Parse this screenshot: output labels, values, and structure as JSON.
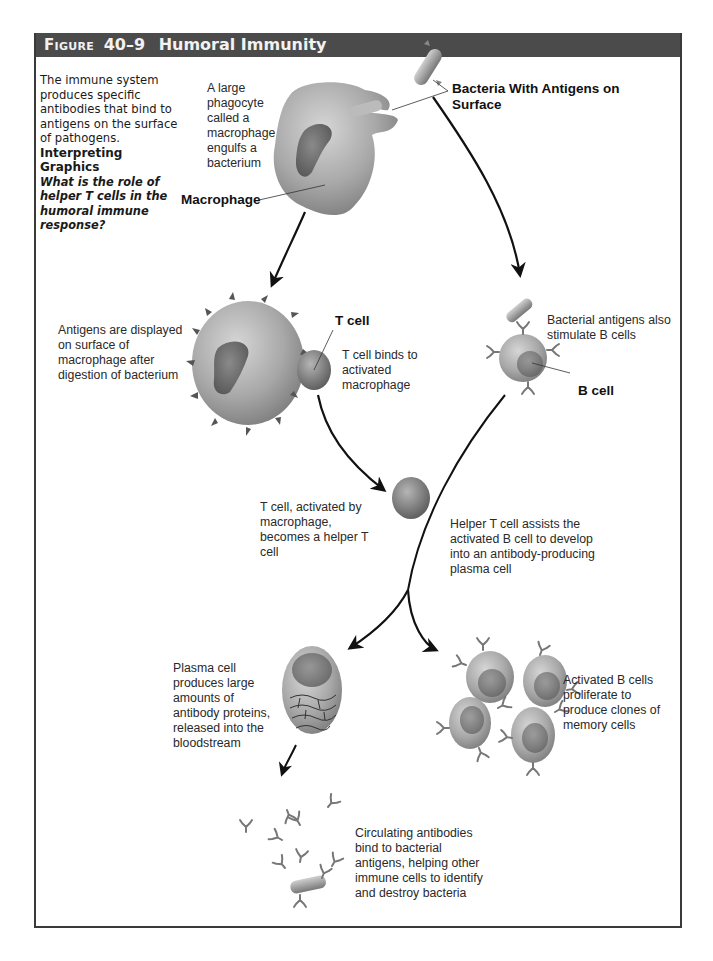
{
  "figure": {
    "label": "Figure",
    "number": "40–9",
    "title": "Humoral Immunity",
    "colors": {
      "titlebar": "#4b4b4b",
      "title_text": "#f2f2f2",
      "frame": "#3a3a3a",
      "cell_gray": "#9a9a9a",
      "nucleus": "#6e6e6e",
      "arrow": "#111111"
    }
  },
  "intro": {
    "text": "The immune system produces specific antibodies that bind to antigens on the surface of pathogens.",
    "heading": "Interpreting Graphics",
    "question": "What is the role of helper T cells in the humoral immune response?"
  },
  "labels": {
    "bacteria": "Bacteria With Antigens on Surface",
    "macrophage": "Macrophage",
    "t_cell": "T cell",
    "b_cell": "B cell"
  },
  "captions": {
    "engulf": "A large phagocyte called a macrophage engulfs a bacterium",
    "display": "Antigens are displayed on surface of macrophage after digestion of bacterium",
    "t_binds": "T cell binds to activated macrophage",
    "b_stim": "Bacterial antigens also stimulate B cells",
    "helper": "T cell, activated by macrophage, becomes a helper T cell",
    "helper_assist": "Helper T cell assists the activated B cell to develop into an antibody-producing plasma cell",
    "plasma": "Plasma cell produces large amounts of antibody proteins, released into the bloodstream",
    "memory": "Activated B cells proliferate to produce clones of memory cells",
    "circulating": "Circulating antibodies bind to bacterial antigens, helping other immune cells to identify and destroy bacteria"
  },
  "steps": [
    {
      "id": "engulf",
      "stage": 1
    },
    {
      "id": "display",
      "stage": 2
    },
    {
      "id": "b_stim",
      "stage": 2
    },
    {
      "id": "helper",
      "stage": 3
    },
    {
      "id": "helper_assist",
      "stage": 3
    },
    {
      "id": "plasma",
      "stage": 4
    },
    {
      "id": "memory",
      "stage": 4
    },
    {
      "id": "circulating",
      "stage": 5
    }
  ]
}
